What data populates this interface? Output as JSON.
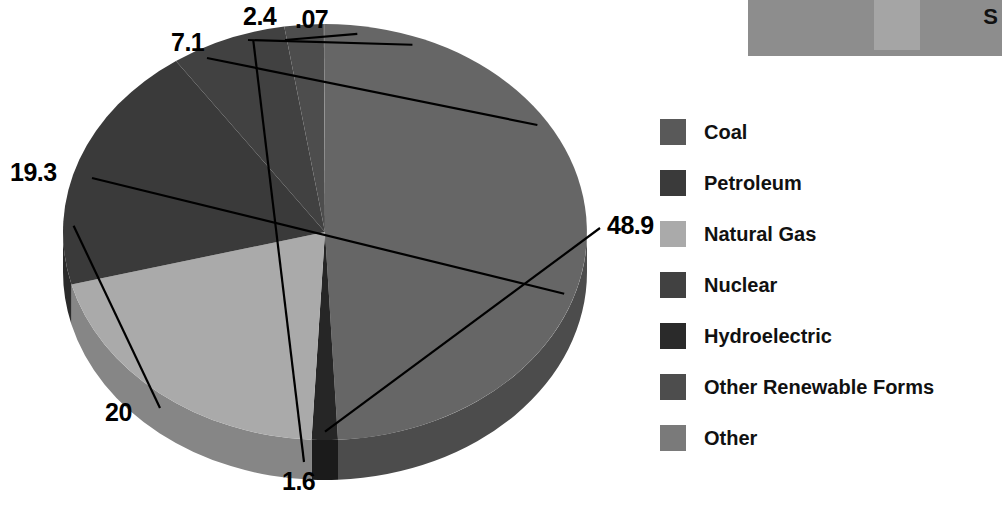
{
  "chart_data": {
    "type": "pie",
    "title": "",
    "subtitle": "",
    "xlabel": "",
    "ylabel": "",
    "legend_position": "right",
    "three_d": true,
    "units": "percent",
    "start_angle_deg": 0,
    "direction": "clockwise",
    "categories": [
      "Coal",
      "Petroleum",
      "Natural Gas",
      "Nuclear",
      "Hydroelectric",
      "Other Renewable Forms",
      "Other"
    ],
    "values": [
      48.9,
      19.3,
      20,
      7.1,
      1.6,
      2.4,
      0.07
    ],
    "labels": [
      "48.9",
      "19.3",
      "20",
      "7.1",
      "1.6",
      "2.4",
      ".07"
    ],
    "colors": [
      "#666666",
      "#3a3a3a",
      "#aaaaaa",
      "#414141",
      "#262626",
      "#4d4d4d",
      "#7d7d7d"
    ],
    "draw_order_clockwise_from_top": [
      {
        "name": "Coal",
        "value": 48.9,
        "label": "48.9",
        "color": "#666666",
        "rim": "#4c4c4c"
      },
      {
        "name": "Hydroelectric",
        "value": 1.6,
        "label": "1.6",
        "color": "#262626",
        "rim": "#1b1b1b"
      },
      {
        "name": "Natural Gas",
        "value": 20,
        "label": "20",
        "color": "#aaaaaa",
        "rim": "#868686"
      },
      {
        "name": "Petroleum",
        "value": 19.3,
        "label": "19.3",
        "color": "#3a3a3a",
        "rim": "#2b2b2b"
      },
      {
        "name": "Nuclear",
        "value": 7.1,
        "label": "7.1",
        "color": "#414141",
        "rim": "#313131"
      },
      {
        "name": "Other Renewable Forms",
        "value": 2.4,
        "label": "2.4",
        "color": "#4d4d4d",
        "rim": "#3a3a3a"
      },
      {
        "name": "Other",
        "value": 0.07,
        "label": ".07",
        "color": "#7d7d7d",
        "rim": "#5f5f5f"
      }
    ]
  },
  "legend": {
    "items": [
      {
        "label": "Coal",
        "color": "#595959"
      },
      {
        "label": "Petroleum",
        "color": "#3a3a3a"
      },
      {
        "label": "Natural Gas",
        "color": "#aaaaaa"
      },
      {
        "label": "Nuclear",
        "color": "#414141"
      },
      {
        "label": "Hydroelectric",
        "color": "#2a2a2a"
      },
      {
        "label": "Other Renewable Forms",
        "color": "#4d4d4d"
      },
      {
        "label": "Other",
        "color": "#7a7a7a"
      }
    ]
  },
  "value_labels": [
    {
      "text": "2.4",
      "x": 243,
      "y": 2
    },
    {
      "text": ".07",
      "x": 295,
      "y": 5
    },
    {
      "text": "7.1",
      "x": 171,
      "y": 28
    },
    {
      "text": "19.3",
      "x": 10,
      "y": 158
    },
    {
      "text": "48.9",
      "x": 607,
      "y": 211
    },
    {
      "text": "20",
      "x": 105,
      "y": 398
    },
    {
      "text": "1.6",
      "x": 282,
      "y": 467
    }
  ],
  "top_panel": {
    "letter": "S"
  }
}
